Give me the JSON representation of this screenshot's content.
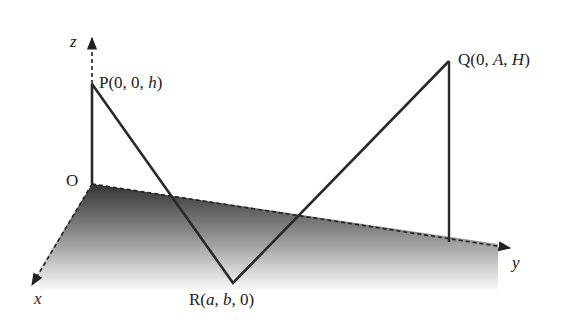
{
  "diagram": {
    "type": "3d-coordinate-geometry",
    "axes": {
      "x": {
        "label": "x"
      },
      "y": {
        "label": "y"
      },
      "z": {
        "label": "z"
      }
    },
    "points": {
      "origin": {
        "label": "O"
      },
      "P": {
        "name": "P",
        "coords": [
          "0",
          "0",
          "h"
        ],
        "text_prefix": "P(0, 0, ",
        "text_var": "h",
        "text_suffix": ")"
      },
      "Q": {
        "name": "Q",
        "coords": [
          "0",
          "A",
          "H"
        ],
        "text_prefix": "Q(0, ",
        "text_var1": "A",
        "text_sep": ", ",
        "text_var2": "H",
        "text_suffix": ")"
      },
      "R": {
        "name": "R",
        "coords": [
          "a",
          "b",
          "0"
        ],
        "text_prefix": "R(",
        "text_var1": "a",
        "text_sep1": ", ",
        "text_var2": "b",
        "text_sep2": ", 0)"
      }
    },
    "segments": [
      "OP",
      "PR",
      "RQ",
      "Q-to-y-axis vertical"
    ],
    "colors": {
      "line": "#2a2a2a",
      "plane_dark": "#3a3a3a",
      "plane_light": "#ffffff"
    }
  }
}
